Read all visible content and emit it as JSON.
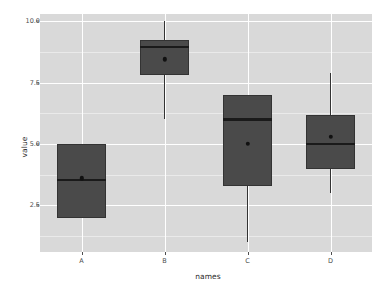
{
  "chart_data": {
    "type": "box",
    "title": "",
    "xlabel": "names",
    "ylabel": "value",
    "categories": [
      "A",
      "B",
      "C",
      "D"
    ],
    "ylim": [
      0.6,
      10.3
    ],
    "y_ticks": [
      2.5,
      5.0,
      7.5,
      10.0
    ],
    "y_tick_labels": [
      "2.5",
      "5.0",
      "7.5",
      "10.0"
    ],
    "y_minor_ticks": [
      1.25,
      3.75,
      6.25,
      8.75
    ],
    "grid": true,
    "legend": "none",
    "boxes": [
      {
        "name": "A",
        "whisker_low": 2.0,
        "q1": 2.0,
        "median": 3.55,
        "q3": 5.0,
        "whisker_high": 5.0,
        "mean": 3.6
      },
      {
        "name": "B",
        "whisker_low": 6.0,
        "q1": 7.8,
        "median": 8.95,
        "q3": 9.25,
        "whisker_high": 10.0,
        "mean": 8.45
      },
      {
        "name": "C",
        "whisker_low": 1.0,
        "q1": 3.3,
        "median": 6.0,
        "q3": 7.0,
        "whisker_high": 7.0,
        "mean": 5.0
      },
      {
        "name": "D",
        "whisker_low": 3.0,
        "q1": 4.0,
        "median": 5.0,
        "q3": 6.2,
        "whisker_high": 7.9,
        "mean": 5.3
      }
    ],
    "colors": {
      "panel_background": "#d9d9d9",
      "grid_major": "#ffffff",
      "grid_minor": "#eaeaea",
      "box_fill": "#4a4a4a",
      "box_outline": "#333333",
      "median": "#1a1a1a",
      "mean_point": "#111111",
      "text": "#4d4d4d",
      "axis_title": "#2b2b2b",
      "page_background": "#ffffff"
    }
  }
}
